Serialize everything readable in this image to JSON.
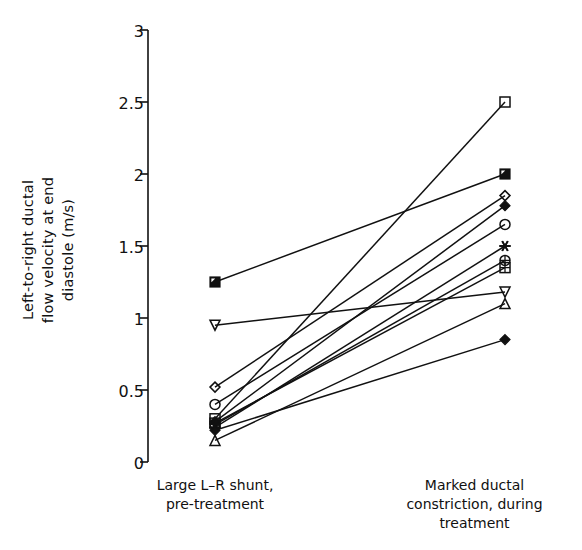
{
  "figure": {
    "background": "#ffffff",
    "line_color": "#111111",
    "marker_color": "#111111"
  },
  "chart_data": {
    "type": "line",
    "title": "",
    "xlabel": "",
    "ylabel": "Left-to-right ductal\nflow velocity at end\ndiastole (m/s)",
    "ylim": [
      0,
      3
    ],
    "yticks": [
      0,
      0.5,
      1,
      1.5,
      2,
      2.5,
      3
    ],
    "ytick_labels": [
      "0",
      "0.5",
      "1",
      "1.5",
      "2",
      "2.5",
      "3"
    ],
    "grid": false,
    "legend": "none",
    "categories": [
      "Large L–R shunt,\npre-treatment",
      "Marked ductal\nconstriction, during\ntreatment"
    ],
    "x": [
      1,
      2
    ],
    "series": [
      {
        "name": "subject-1",
        "marker": "square-open",
        "values": [
          0.3,
          2.5
        ]
      },
      {
        "name": "subject-2",
        "marker": "square-half-filled",
        "values": [
          1.25,
          2.0
        ]
      },
      {
        "name": "subject-3",
        "marker": "diamond-open",
        "values": [
          0.52,
          1.85
        ]
      },
      {
        "name": "subject-4",
        "marker": "diamond-filled",
        "values": [
          0.28,
          1.78
        ]
      },
      {
        "name": "subject-5",
        "marker": "circle-open",
        "values": [
          0.4,
          1.65
        ]
      },
      {
        "name": "subject-6",
        "marker": "asterisk",
        "values": [
          0.24,
          1.5
        ]
      },
      {
        "name": "subject-7",
        "marker": "circle-plus",
        "values": [
          0.26,
          1.4
        ]
      },
      {
        "name": "subject-8",
        "marker": "square-grid",
        "values": [
          0.27,
          1.35
        ]
      },
      {
        "name": "subject-9",
        "marker": "triangle-down",
        "values": [
          0.95,
          1.18
        ]
      },
      {
        "name": "subject-10",
        "marker": "triangle-up",
        "values": [
          0.15,
          1.1
        ]
      },
      {
        "name": "subject-11",
        "marker": "diamond-round",
        "values": [
          0.22,
          0.85
        ]
      }
    ]
  },
  "axes": {
    "y_tick_0": "0",
    "y_tick_05": "0.5",
    "y_tick_1": "1",
    "y_tick_15": "1.5",
    "y_tick_2": "2",
    "y_tick_25": "2.5",
    "y_tick_3": "3",
    "y_axis_title": "Left-to-right ductal\nflow velocity at end\ndiastole (m/s)",
    "x_category_left": "Large L–R shunt,\npre-treatment",
    "x_category_right": "Marked ductal\nconstriction, during\ntreatment"
  }
}
